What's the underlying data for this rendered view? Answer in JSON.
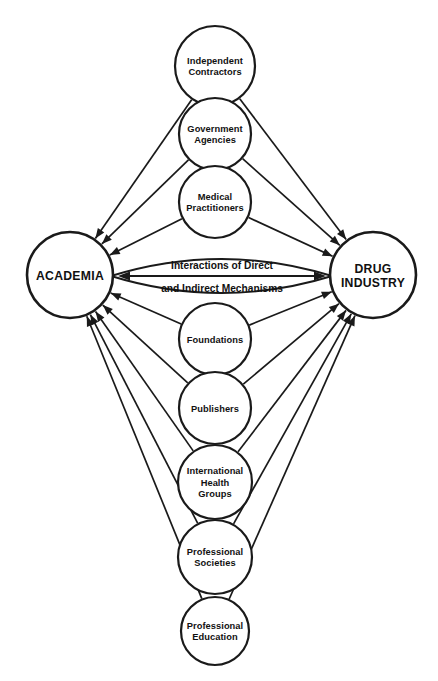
{
  "diagram": {
    "title": "Interactions of Direct and Indirect Mechanisms",
    "type": "hub-and-spoke influence diagram",
    "background_color": "#ffffff",
    "line_color": "#1a1a1a",
    "hubs": {
      "left": {
        "id": "academia",
        "label": "ACADEMIA",
        "label_lines": [
          "ACADEMIA"
        ],
        "cx": 70,
        "cy": 275,
        "r": 43
      },
      "right": {
        "id": "drug-industry",
        "label": "DRUG INDUSTRY",
        "label_lines": [
          "DRUG",
          "INDUSTRY"
        ],
        "cx": 373,
        "cy": 275,
        "r": 43
      }
    },
    "center_link": {
      "line1": "Interactions of Direct",
      "line2": "and Indirect Mechanisms",
      "arrow": "double-headed",
      "x1": 118,
      "x2": 326,
      "y": 276
    },
    "satellites": [
      {
        "id": "independent-contractors",
        "label": "Independent Contractors",
        "label_lines": [
          "Independent",
          "Contractors"
        ],
        "cx": 215,
        "cy": 66,
        "r": 40,
        "position": "upper"
      },
      {
        "id": "government-agencies",
        "label": "Government Agencies",
        "label_lines": [
          "Government",
          "Agencies"
        ],
        "cx": 215,
        "cy": 134,
        "r": 36,
        "position": "upper"
      },
      {
        "id": "medical-practitioners",
        "label": "Medical Practitioners",
        "label_lines": [
          "Medical",
          "Practitioners"
        ],
        "cx": 215,
        "cy": 202,
        "r": 36,
        "position": "upper"
      },
      {
        "id": "foundations",
        "label": "Foundations",
        "label_lines": [
          "Foundations"
        ],
        "cx": 215,
        "cy": 339,
        "r": 36,
        "position": "lower"
      },
      {
        "id": "publishers",
        "label": "Publishers",
        "label_lines": [
          "Publishers"
        ],
        "cx": 215,
        "cy": 408,
        "r": 36,
        "position": "lower"
      },
      {
        "id": "international-health-groups",
        "label": "International Health Groups",
        "label_lines": [
          "International",
          "Health",
          "Groups"
        ],
        "cx": 215,
        "cy": 482,
        "r": 37,
        "position": "lower"
      },
      {
        "id": "professional-societies",
        "label": "Professional Societies",
        "label_lines": [
          "Professional",
          "Societies"
        ],
        "cx": 215,
        "cy": 557,
        "r": 37,
        "position": "lower"
      },
      {
        "id": "professional-education",
        "label": "Professional Education",
        "label_lines": [
          "Professional",
          "Education"
        ],
        "cx": 215,
        "cy": 631,
        "r": 34,
        "position": "lower"
      }
    ],
    "edges_note": "Every satellite node sends a directed arrow to both ACADEMIA and DRUG INDUSTRY; the two hubs are joined by a double-headed arrow."
  }
}
